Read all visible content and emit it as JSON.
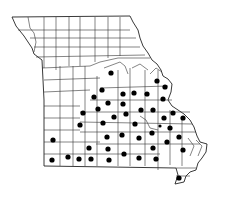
{
  "map": {
    "region": "Missouri",
    "subdivisions": "counties",
    "marker_style": "filled-black-dot",
    "colors": {
      "background": "#ffffff",
      "outline": "#333333",
      "marker": "#000000"
    },
    "markers": [
      {
        "x": 111,
        "y": 73
      },
      {
        "x": 157,
        "y": 81
      },
      {
        "x": 102,
        "y": 90
      },
      {
        "x": 165,
        "y": 87
      },
      {
        "x": 94,
        "y": 97
      },
      {
        "x": 123,
        "y": 94
      },
      {
        "x": 134,
        "y": 93
      },
      {
        "x": 147,
        "y": 94
      },
      {
        "x": 163,
        "y": 99
      },
      {
        "x": 108,
        "y": 103
      },
      {
        "x": 123,
        "y": 104
      },
      {
        "x": 98,
        "y": 109
      },
      {
        "x": 141,
        "y": 110
      },
      {
        "x": 153,
        "y": 110
      },
      {
        "x": 173,
        "y": 113
      },
      {
        "x": 83,
        "y": 113
      },
      {
        "x": 126,
        "y": 114
      },
      {
        "x": 114,
        "y": 117
      },
      {
        "x": 183,
        "y": 118
      },
      {
        "x": 164,
        "y": 118
      },
      {
        "x": 80,
        "y": 125
      },
      {
        "x": 103,
        "y": 123
      },
      {
        "x": 135,
        "y": 124
      },
      {
        "x": 160,
        "y": 126,
        "r": 1.6
      },
      {
        "x": 152,
        "y": 133
      },
      {
        "x": 170,
        "y": 128
      },
      {
        "x": 107,
        "y": 137
      },
      {
        "x": 122,
        "y": 135
      },
      {
        "x": 139,
        "y": 138
      },
      {
        "x": 179,
        "y": 137
      },
      {
        "x": 167,
        "y": 142
      },
      {
        "x": 53,
        "y": 140
      },
      {
        "x": 89,
        "y": 148
      },
      {
        "x": 108,
        "y": 149
      },
      {
        "x": 153,
        "y": 148
      },
      {
        "x": 183,
        "y": 150
      },
      {
        "x": 68,
        "y": 157
      },
      {
        "x": 52,
        "y": 160
      },
      {
        "x": 79,
        "y": 159
      },
      {
        "x": 91,
        "y": 159
      },
      {
        "x": 109,
        "y": 160
      },
      {
        "x": 124,
        "y": 154
      },
      {
        "x": 139,
        "y": 158
      },
      {
        "x": 156,
        "y": 159
      },
      {
        "x": 179,
        "y": 178
      }
    ]
  }
}
